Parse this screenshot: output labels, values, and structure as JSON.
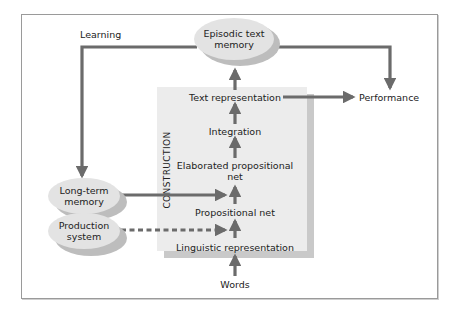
{
  "diagram": {
    "construction_label": "CONSTRUCTION",
    "nodes": {
      "episodic": "Episodic text\nmemory",
      "episodic_line1": "Episodic text",
      "episodic_line2": "memory",
      "text_representation": "Text representation",
      "integration": "Integration",
      "elaborated_line1": "Elaborated propositional",
      "elaborated_line2": "net",
      "propositional_net": "Propositional net",
      "linguistic_representation": "Linguistic representation",
      "words": "Words",
      "long_term_line1": "Long-term",
      "long_term_line2": "memory",
      "production_line1": "Production",
      "production_line2": "system",
      "performance": "Performance",
      "learning": "Learning"
    },
    "edges": [
      {
        "from": "Words",
        "to": "Linguistic representation",
        "style": "solid"
      },
      {
        "from": "Linguistic representation",
        "to": "Propositional net",
        "style": "solid"
      },
      {
        "from": "Propositional net",
        "to": "Elaborated propositional net",
        "style": "solid"
      },
      {
        "from": "Elaborated propositional net",
        "to": "Integration",
        "style": "solid"
      },
      {
        "from": "Integration",
        "to": "Text representation",
        "style": "solid"
      },
      {
        "from": "Text representation",
        "to": "Episodic text memory",
        "style": "solid"
      },
      {
        "from": "Text representation",
        "to": "Performance",
        "style": "solid"
      },
      {
        "from": "Episodic text memory",
        "to": "Performance",
        "style": "solid"
      },
      {
        "from": "Episodic text memory",
        "to": "Long-term memory",
        "style": "solid",
        "label": "Learning"
      },
      {
        "from": "Long-term memory",
        "to": "Propositional net",
        "style": "solid"
      },
      {
        "from": "Production system",
        "to": "Linguistic representation",
        "style": "dashed"
      }
    ],
    "colors": {
      "arrow": "#6b6b6b",
      "construction_box": "#ececec",
      "construction_shadow": "#c9c9c9",
      "ellipse_face": "#e3e3e3",
      "ellipse_shadow": "#bdbdbd",
      "frame_border": "#9a9a9a"
    }
  }
}
